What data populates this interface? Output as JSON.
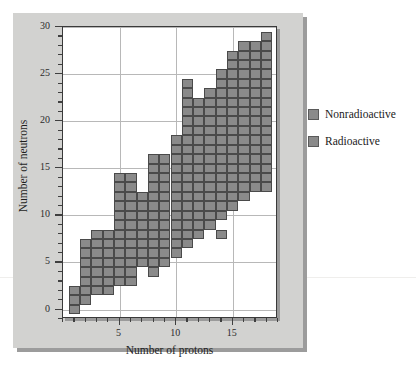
{
  "chart_data": {
    "type": "heatmap",
    "title": "",
    "xlabel": "Number of protons",
    "ylabel": "Number of neutrons",
    "xlim": [
      0,
      19
    ],
    "ylim": [
      -1,
      30
    ],
    "xticks": [
      5,
      10,
      15
    ],
    "yticks": [
      0,
      5,
      10,
      15,
      20,
      25,
      30
    ],
    "xminor_step": 1,
    "yminor_step": 1,
    "grid": true,
    "legend_position": "right",
    "series": [
      {
        "name": "Nonradioactive",
        "color": "#8a8a8a"
      },
      {
        "name": "Radioactive",
        "color": "#8a8a8a"
      }
    ],
    "columns": [
      {
        "protons": 1,
        "neutron_min": 0,
        "neutron_max": 2
      },
      {
        "protons": 2,
        "neutron_min": 1,
        "neutron_max": 7
      },
      {
        "protons": 3,
        "neutron_min": 2,
        "neutron_max": 8
      },
      {
        "protons": 4,
        "neutron_min": 2,
        "neutron_max": 8
      },
      {
        "protons": 5,
        "neutron_min": 3,
        "neutron_max": 14
      },
      {
        "protons": 6,
        "neutron_min": 3,
        "neutron_max": 14
      },
      {
        "protons": 7,
        "neutron_min": 5,
        "neutron_max": 12
      },
      {
        "protons": 8,
        "neutron_min": 4,
        "neutron_max": 16
      },
      {
        "protons": 9,
        "neutron_min": 5,
        "neutron_max": 16
      },
      {
        "protons": 10,
        "neutron_min": 6,
        "neutron_max": 18
      },
      {
        "protons": 11,
        "neutron_min": 7,
        "neutron_max": 24
      },
      {
        "protons": 12,
        "neutron_min": 8,
        "neutron_max": 22
      },
      {
        "protons": 13,
        "neutron_min": 9,
        "neutron_max": 23
      },
      {
        "protons": 14,
        "neutron_min": 10,
        "neutron_max": 25
      },
      {
        "protons": 15,
        "neutron_min": 11,
        "neutron_max": 27
      },
      {
        "protons": 16,
        "neutron_min": 12,
        "neutron_max": 28
      },
      {
        "protons": 17,
        "neutron_min": 13,
        "neutron_max": 28
      },
      {
        "protons": 18,
        "neutron_min": 13,
        "neutron_max": 29
      }
    ],
    "extra_cells": [
      {
        "protons": 14,
        "neutrons": 8
      }
    ]
  },
  "axes": {
    "x_title": "Number of protons",
    "y_title": "Number of neutrons",
    "x_tick_labels": [
      "5",
      "10",
      "15"
    ],
    "y_tick_labels": [
      "0",
      "5",
      "10",
      "15",
      "20",
      "25",
      "30"
    ]
  },
  "legend": {
    "items": [
      {
        "label": "Nonradioactive",
        "color": "#8a8a8a"
      },
      {
        "label": "Radioactive",
        "color": "#8a8a8a"
      }
    ]
  },
  "colors": {
    "cell_fill": "#8a8a8a",
    "cell_border": "#4a4a4a",
    "card_bg": "#d2d2d0",
    "plot_bg": "#ffffff",
    "grid": "#b8b8b8",
    "frame": "#3a3a3a",
    "text": "#1a1a1a"
  }
}
